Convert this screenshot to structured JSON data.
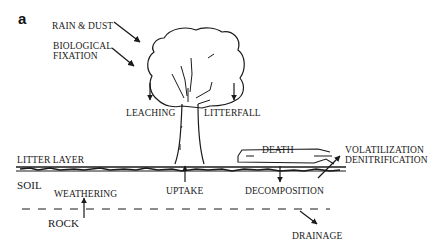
{
  "figure": {
    "panel_label": "a",
    "inputs": {
      "rain_dust": "RAIN  & DUST",
      "bio_fixation_line1": "BIOLOGICAL",
      "bio_fixation_line2": "FIXATION"
    },
    "tree_processes": {
      "leaching": "LEACHING",
      "litterfall": "LITTERFALL"
    },
    "layers": {
      "litter_layer": "LITTER LAYER",
      "soil": "SOIL",
      "rock": "ROCK"
    },
    "soil_processes": {
      "weathering": "WEATHERING",
      "uptake": "UPTAKE",
      "death": "DEATH",
      "decomposition": "DECOMPOSITION",
      "volatilization": "VOLATILIZATION",
      "denitrification": "DENITRIFICATION",
      "drainage": "DRAINAGE"
    },
    "colors": {
      "ink": "#1a1a1a",
      "background": "#ffffff"
    }
  }
}
